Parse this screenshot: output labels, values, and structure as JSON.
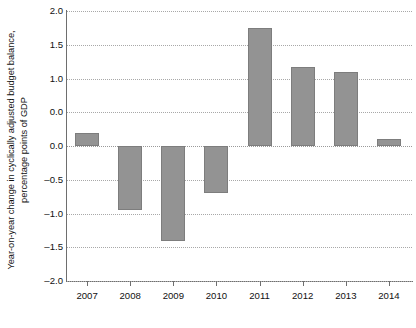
{
  "chart_data": {
    "type": "bar",
    "title": "",
    "subtitle": "",
    "xlabel": "",
    "ylabel": "Year-on-year change in cyclically adjusted budget balance, percentage points of GDP",
    "ylabel_lines": [
      "Year-on-year change in cyclically adjusted budget balance,",
      "percentage points of GDP"
    ],
    "categories": [
      "2007",
      "2008",
      "2009",
      "2010",
      "2011",
      "2012",
      "2013",
      "2014"
    ],
    "values": [
      0.2,
      -0.95,
      -1.4,
      -0.7,
      1.75,
      1.17,
      1.1,
      0.1
    ],
    "ylim": [
      -2.0,
      2.0
    ],
    "ytick_values": [
      2.0,
      1.5,
      1.0,
      0.5,
      0.0,
      -0.5,
      -1.0,
      -1.5,
      -2.0
    ],
    "ytick_labels": [
      "2.0",
      "1.5",
      "1.0",
      "0.0",
      "0.0",
      "–0.5",
      "–1.0",
      "–1.5",
      "–2.0"
    ],
    "grid": true,
    "grid_style": "dotted",
    "legend": "none",
    "bar_color": "#939393",
    "bar_edge_color": "#7d7d7d",
    "grid_color": "#a8a8a8",
    "axis_color": "#6e6e6e"
  },
  "axis": {
    "y": {
      "ticks": [
        {
          "label": "2.0"
        },
        {
          "label": "1.5"
        },
        {
          "label": "1.0"
        },
        {
          "label": "0.0"
        },
        {
          "label": "0.0"
        },
        {
          "label": "–0.5"
        },
        {
          "label": "–1.0"
        },
        {
          "label": "–1.5"
        },
        {
          "label": "–2.0"
        }
      ]
    },
    "x": {
      "ticks": [
        {
          "label": "2007"
        },
        {
          "label": "2008"
        },
        {
          "label": "2009"
        },
        {
          "label": "2010"
        },
        {
          "label": "2011"
        },
        {
          "label": "2012"
        },
        {
          "label": "2013"
        },
        {
          "label": "2014"
        }
      ]
    }
  },
  "caption": ""
}
